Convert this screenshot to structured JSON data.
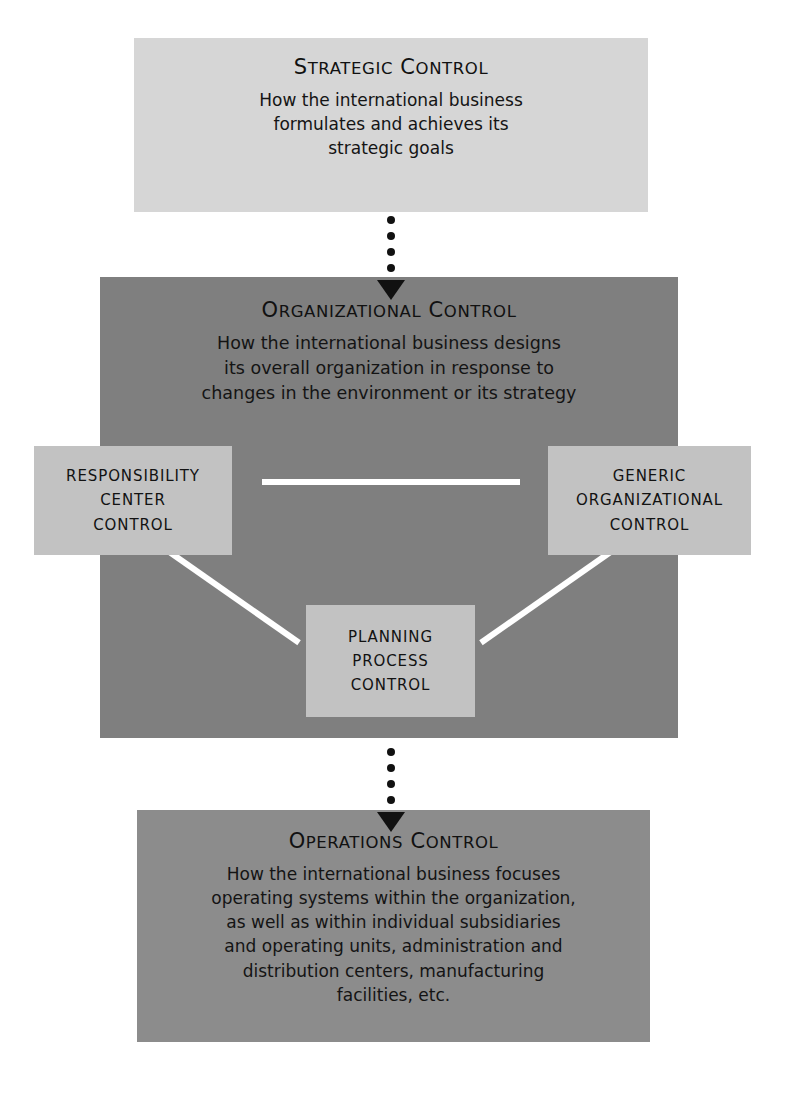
{
  "diagram": {
    "colors": {
      "strategic_bg": "#d6d6d6",
      "organizational_bg": "#7f7f7f",
      "operations_bg": "#8c8c8c",
      "subbox_bg": "#c2c2c2",
      "connector": "#ffffff",
      "text": "#111111",
      "page_bg": "#ffffff"
    },
    "levels": [
      {
        "id": "strategic",
        "heading_first": "S",
        "heading_first_rest": "TRATEGIC",
        "heading_second": "C",
        "heading_second_rest": "ONTROL",
        "heading_plain": "STRATEGIC CONTROL",
        "body_lines": [
          "How the international business",
          "formulates and achieves its",
          "strategic goals"
        ]
      },
      {
        "id": "organizational",
        "heading_first": "O",
        "heading_first_rest": "RGANIZATIONAL",
        "heading_second": "C",
        "heading_second_rest": "ONTROL",
        "heading_plain": "ORGANIZATIONAL CONTROL",
        "body_lines": [
          "How the international business designs",
          "its overall organization in response to",
          "changes in the environment or its strategy"
        ]
      },
      {
        "id": "operations",
        "heading_first": "O",
        "heading_first_rest": "PERATIONS",
        "heading_second": "C",
        "heading_second_rest": "ONTROL",
        "heading_plain": "OPERATIONS CONTROL",
        "body_lines": [
          "How the international business focuses",
          "operating systems within the organization,",
          "as well as within individual subsidiaries",
          "and operating units, administration and",
          "distribution centers, manufacturing",
          "facilities, etc."
        ]
      }
    ],
    "subboxes": [
      {
        "id": "responsibility-center-control",
        "lines": [
          "RESPONSIBILITY",
          "CENTER",
          "CONTROL"
        ]
      },
      {
        "id": "generic-organizational-control",
        "lines": [
          "GENERIC",
          "ORGANIZATIONAL",
          "CONTROL"
        ]
      },
      {
        "id": "planning-process-control",
        "lines": [
          "PLANNING",
          "PROCESS",
          "CONTROL"
        ]
      }
    ],
    "arrows": [
      {
        "id": "strategic-to-organizational",
        "style": "dotted-down",
        "dots": 4
      },
      {
        "id": "organizational-to-operations",
        "style": "dotted-down",
        "dots": 4
      }
    ],
    "connectors": [
      {
        "id": "responsibility-to-generic",
        "orientation": "horizontal"
      },
      {
        "id": "responsibility-to-planning",
        "orientation": "diagonal"
      },
      {
        "id": "generic-to-planning",
        "orientation": "diagonal"
      }
    ]
  }
}
